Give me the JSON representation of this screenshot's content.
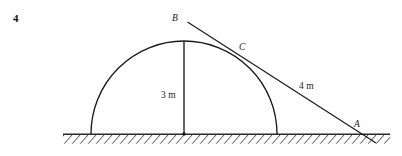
{
  "figure": {
    "question_number": "4",
    "points": [
      {
        "id": "point-b",
        "label": "B"
      },
      {
        "id": "point-c",
        "label": "C"
      },
      {
        "id": "point-a",
        "label": "A"
      }
    ],
    "dimensions": [
      {
        "id": "vertical-radius",
        "label": "3 m"
      },
      {
        "id": "tangent-segment",
        "label": "4 m"
      }
    ],
    "colors": {
      "ink": "#1a1a1a",
      "ground": "#2b2b2b",
      "background": "#ffffff"
    }
  },
  "geometry": {
    "semicircle": {
      "center_x": 184,
      "center_y": 134,
      "radius": 93
    },
    "ground": {
      "x1": 63,
      "x2": 390,
      "y": 134,
      "hatch_depth": 9
    },
    "vertical_line": {
      "x": 184,
      "y_top": 41,
      "y_bottom": 134
    },
    "tangent_line": {
      "x1": 187,
      "y1": 22,
      "x2": 376,
      "y2": 143
    }
  }
}
